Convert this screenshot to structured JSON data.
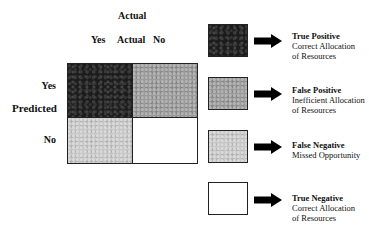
{
  "matrix": {
    "column_axis_title": "Actual",
    "column_labels": {
      "yes": "Yes",
      "middle": "Actual",
      "no": "No"
    },
    "row_axis_title": "Predicted",
    "row_labels": {
      "yes": "Yes",
      "no": "No"
    },
    "cells": [
      {
        "row": "Yes",
        "col": "Yes",
        "shade": "dark",
        "color": "#1c1c1c"
      },
      {
        "row": "Yes",
        "col": "No",
        "shade": "medium",
        "color": "#9a9a9a"
      },
      {
        "row": "No",
        "col": "Yes",
        "shade": "light",
        "color": "#c7c7c7"
      },
      {
        "row": "No",
        "col": "No",
        "shade": "white",
        "color": "#ffffff"
      }
    ]
  },
  "legend": [
    {
      "title": "True Positive",
      "line1": "Correct Allocation",
      "line2": "of Resources",
      "swatch": "#1c1c1c"
    },
    {
      "title": "False Positive",
      "line1": "Inefficient Allocation",
      "line2": "of Resources",
      "swatch": "#9a9a9a"
    },
    {
      "title": "False Negative",
      "line1": "Missed Opportunity",
      "line2": "",
      "swatch": "#c7c7c7"
    },
    {
      "title": "True Negative",
      "line1": "Correct Allocation",
      "line2": "of Resources",
      "swatch": "#ffffff"
    }
  ],
  "icons": {
    "arrow": "right-arrow-icon"
  }
}
